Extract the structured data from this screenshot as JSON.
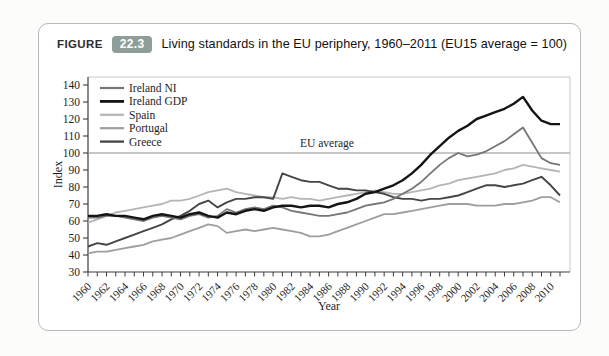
{
  "header": {
    "figure_word": "FIGURE",
    "figure_number": "22.3",
    "title": "Living standards in the EU periphery, 1960–2011 (EU15 average = 100)"
  },
  "colors": {
    "badge_bg": "#8d9e9a",
    "panel_border": "#b6bcbc",
    "axis": "#3c3c3c",
    "box_light": "#c9c9c9",
    "reference_line": "#8f8f8f"
  },
  "chart_data": {
    "type": "line",
    "title": "",
    "xlabel": "Year",
    "ylabel": "Index",
    "ylim": [
      30,
      140
    ],
    "ytick_step": 10,
    "xlim": [
      1960,
      2011
    ],
    "xtick_label_step": 2,
    "xtick_label_end": 2010,
    "grid": false,
    "legend_position": "top-left-inside",
    "reference_line": {
      "value": 100,
      "label": "EU average"
    },
    "x": [
      1960,
      1961,
      1962,
      1963,
      1964,
      1965,
      1966,
      1967,
      1968,
      1969,
      1970,
      1971,
      1972,
      1973,
      1974,
      1975,
      1976,
      1977,
      1978,
      1979,
      1980,
      1981,
      1982,
      1983,
      1984,
      1985,
      1986,
      1987,
      1988,
      1989,
      1990,
      1991,
      1992,
      1993,
      1994,
      1995,
      1996,
      1997,
      1998,
      1999,
      2000,
      2001,
      2002,
      2003,
      2004,
      2005,
      2006,
      2007,
      2008,
      2009,
      2010,
      2011
    ],
    "series": [
      {
        "name": "Ireland NI",
        "color": "#767676",
        "width": 1.8,
        "values": [
          62,
          62,
          63,
          63,
          62,
          61,
          60,
          62,
          63,
          62,
          61,
          63,
          64,
          62,
          63,
          67,
          65,
          67,
          68,
          67,
          69,
          68,
          66,
          65,
          64,
          63,
          63,
          64,
          65,
          67,
          69,
          70,
          71,
          73,
          76,
          79,
          83,
          88,
          93,
          97,
          100,
          98,
          99,
          101,
          104,
          107,
          111,
          115,
          106,
          97,
          94,
          93
        ]
      },
      {
        "name": "Ireland GDP",
        "color": "#141414",
        "width": 2.4,
        "values": [
          63,
          63,
          64,
          63,
          63,
          62,
          61,
          63,
          64,
          63,
          62,
          64,
          65,
          63,
          62,
          65,
          64,
          66,
          67,
          66,
          68,
          69,
          69,
          68,
          69,
          69,
          68,
          70,
          71,
          73,
          76,
          77,
          79,
          81,
          84,
          88,
          93,
          99,
          104,
          109,
          113,
          116,
          120,
          122,
          124,
          126,
          129,
          133,
          125,
          119,
          117,
          117
        ]
      },
      {
        "name": "Spain",
        "color": "#b5b5b5",
        "width": 1.8,
        "values": [
          59,
          61,
          63,
          65,
          66,
          67,
          68,
          69,
          70,
          72,
          72,
          73,
          75,
          77,
          78,
          79,
          77,
          76,
          75,
          74,
          74,
          73,
          74,
          73,
          73,
          72,
          73,
          74,
          75,
          76,
          77,
          78,
          77,
          76,
          76,
          77,
          78,
          79,
          81,
          82,
          84,
          85,
          86,
          87,
          88,
          90,
          91,
          93,
          92,
          91,
          90,
          89
        ]
      },
      {
        "name": "Portugal",
        "color": "#9e9e9e",
        "width": 1.8,
        "values": [
          41,
          42,
          42,
          43,
          44,
          45,
          46,
          48,
          49,
          50,
          52,
          54,
          56,
          58,
          57,
          53,
          54,
          55,
          54,
          55,
          56,
          55,
          54,
          53,
          51,
          51,
          52,
          54,
          56,
          58,
          60,
          62,
          64,
          64,
          65,
          66,
          67,
          68,
          69,
          70,
          70,
          70,
          69,
          69,
          69,
          70,
          70,
          71,
          72,
          74,
          74,
          71
        ]
      },
      {
        "name": "Greece",
        "color": "#454545",
        "width": 1.9,
        "values": [
          45,
          47,
          46,
          48,
          50,
          52,
          54,
          56,
          58,
          61,
          63,
          66,
          70,
          72,
          68,
          71,
          73,
          73,
          74,
          74,
          73,
          88,
          86,
          84,
          83,
          83,
          81,
          79,
          79,
          78,
          78,
          77,
          76,
          74,
          73,
          73,
          72,
          73,
          73,
          74,
          75,
          77,
          79,
          81,
          81,
          80,
          81,
          82,
          84,
          86,
          81,
          75
        ]
      }
    ]
  }
}
